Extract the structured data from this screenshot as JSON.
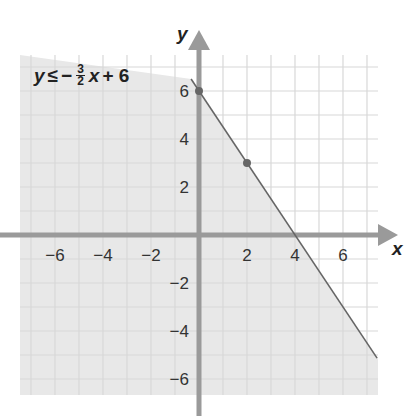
{
  "chart_data": {
    "type": "line",
    "title": "",
    "annotation": {
      "lhs": "y",
      "relation": "≤",
      "sign": "−",
      "frac_num": "3",
      "frac_den": "2",
      "var": "x",
      "rest": "+ 6",
      "full": "y ≤ −3/2 x + 6"
    },
    "xlabel": "x",
    "ylabel": "y",
    "xlim": [
      -7.5,
      7.5
    ],
    "ylim": [
      -6.5,
      7
    ],
    "x_ticks": [
      -6,
      -4,
      -2,
      2,
      4,
      6
    ],
    "y_ticks": [
      6,
      4,
      2,
      -2,
      -4,
      -6
    ],
    "x_tick_labels": [
      "−6",
      "−4",
      "−2",
      "2",
      "4",
      "6"
    ],
    "y_tick_labels": [
      "6",
      "4",
      "2",
      "−2",
      "−4",
      "−6"
    ],
    "grid": true,
    "series": [
      {
        "name": "boundary line y = -3/2 x + 6",
        "style": "solid",
        "x": [
          -0.33,
          7.42
        ],
        "y": [
          6.5,
          -5.13
        ]
      }
    ],
    "points": [
      {
        "x": 0,
        "y": 6
      },
      {
        "x": 2,
        "y": 3
      }
    ],
    "shaded_region": "below line (y ≤ -3/2 x + 6)",
    "colors": {
      "shade": "#e8e8e8",
      "grid": "#d8d8d8",
      "axis": "#9a9a9a",
      "line": "#666666",
      "point": "#666666"
    }
  }
}
